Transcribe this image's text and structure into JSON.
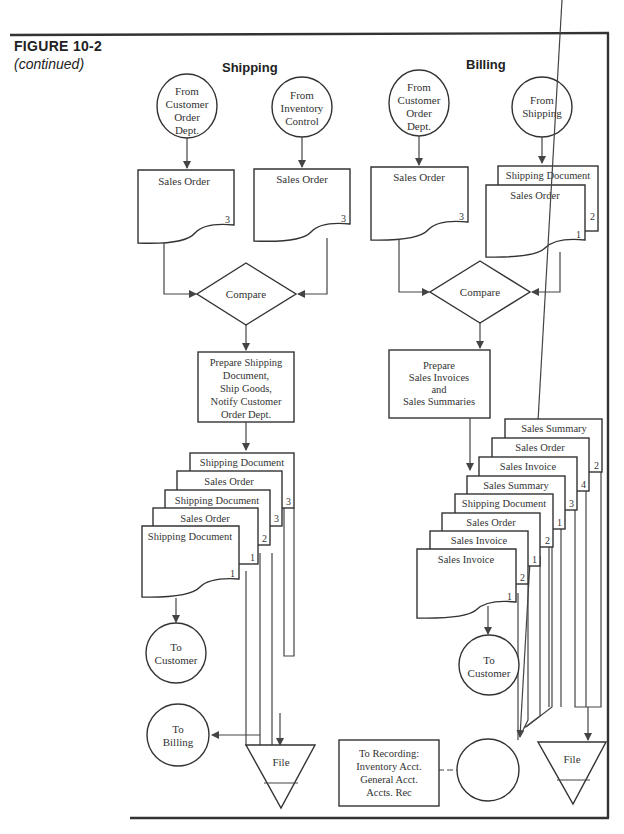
{
  "figure": {
    "number": "FIGURE  10-2",
    "subtitle": "(continued)"
  },
  "columns": {
    "shipping": {
      "title": "Shipping"
    },
    "billing": {
      "title": "Billing"
    }
  },
  "shipping": {
    "connector_from_customer_order": [
      "From",
      "Customer",
      "Order",
      "Dept."
    ],
    "connector_from_inventory": [
      "From",
      "Inventory",
      "Control"
    ],
    "doc_sales_order_a": {
      "label": "Sales Order",
      "copy": "3"
    },
    "doc_sales_order_b": {
      "label": "Sales Order",
      "copy": "3"
    },
    "decision": "Compare",
    "process": [
      "Prepare Shipping",
      "Document,",
      "Ship Goods,",
      "Notify Customer",
      "Order Dept."
    ],
    "output_stack": [
      {
        "label": "Shipping Document",
        "copy": "3"
      },
      {
        "label": "Sales Order",
        "copy": "3"
      },
      {
        "label": "Shipping Document",
        "copy": "2"
      },
      {
        "label": "Sales Order",
        "copy": "1"
      },
      {
        "label": "Shipping Document",
        "copy": "1"
      }
    ],
    "to_customer": [
      "To",
      "Customer"
    ],
    "to_billing": [
      "To",
      "Billing"
    ],
    "file": "File"
  },
  "billing": {
    "connector_from_customer_order": [
      "From",
      "Customer",
      "Order",
      "Dept."
    ],
    "connector_from_shipping": [
      "From",
      "Shipping"
    ],
    "doc_sales_order": {
      "label": "Sales Order",
      "copy": "3"
    },
    "doc_pair": [
      {
        "label": "Shipping Document",
        "copy": "2"
      },
      {
        "label": "Sales Order",
        "copy": "1"
      }
    ],
    "decision": "Compare",
    "process": [
      "Prepare",
      "Sales Invoices",
      "and",
      "Sales Summaries"
    ],
    "output_stack": [
      {
        "label": "Sales Summary",
        "copy": "2"
      },
      {
        "label": "Sales Order",
        "copy": "4"
      },
      {
        "label": "Sales Invoice",
        "copy": "3"
      },
      {
        "label": "Sales Summary",
        "copy": "1"
      },
      {
        "label": "Shipping Document",
        "copy": "2"
      },
      {
        "label": "Sales Order",
        "copy": "1"
      },
      {
        "label": "Sales Invoice",
        "copy": "2"
      },
      {
        "label": "Sales Invoice",
        "copy": "1"
      }
    ],
    "to_customer": [
      "To",
      "Customer"
    ],
    "recording_note": [
      "To Recording:",
      "Inventory Acct.",
      "General Acct.",
      "Accts. Rec"
    ],
    "file": "File"
  }
}
